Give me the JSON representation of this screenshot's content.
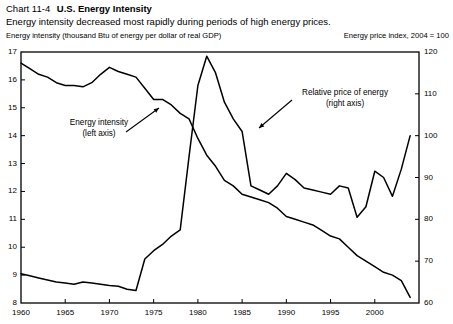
{
  "header": {
    "chart_number": "Chart 11-4",
    "title": "U.S. Energy Intensity",
    "subtitle": "Energy intensity decreased most rapidly during periods of high energy prices."
  },
  "axis_unit_labels": {
    "left": "Energy intensity (thousand Btu of energy per dollar of real GDP)",
    "right": "Energy price index, 2004 = 100"
  },
  "annotations": {
    "left_series": {
      "line1": "Energy intensity",
      "line2": "(left axis)"
    },
    "right_series": {
      "line1": "Relative price of energy",
      "line2": "(right axis)"
    }
  },
  "colors": {
    "line": "#000000",
    "frame": "#000000",
    "text": "#000000",
    "background": "#ffffff"
  },
  "chart_data": {
    "type": "line",
    "title": "U.S. Energy Intensity",
    "subtitle": "Energy intensity decreased most rapidly during periods of high energy prices.",
    "xlabel": "",
    "ylabel": "Energy intensity (thousand Btu of energy per dollar of real GDP)",
    "y2label": "Energy price index, 2004 = 100",
    "xlim": [
      1960,
      2005
    ],
    "ylim": [
      8,
      17
    ],
    "y2lim": [
      60,
      120
    ],
    "yticks": [
      8,
      9,
      10,
      11,
      12,
      13,
      14,
      15,
      16,
      17
    ],
    "y2ticks": [
      60,
      70,
      80,
      90,
      100,
      110,
      120
    ],
    "xticks": [
      1960,
      1965,
      1970,
      1975,
      1980,
      1985,
      1990,
      1995,
      2000
    ],
    "xtick_labels": [
      "1960",
      "1965",
      "1970",
      "1975",
      "1980",
      "1985",
      "1990",
      "1995",
      "2000"
    ],
    "grid": false,
    "legend": "annotations",
    "x": [
      1960,
      1961,
      1962,
      1963,
      1964,
      1965,
      1966,
      1967,
      1968,
      1969,
      1970,
      1971,
      1972,
      1973,
      1974,
      1975,
      1976,
      1977,
      1978,
      1979,
      1980,
      1981,
      1982,
      1983,
      1984,
      1985,
      1986,
      1987,
      1988,
      1989,
      1990,
      1991,
      1992,
      1993,
      1994,
      1995,
      1996,
      1997,
      1998,
      1999,
      2000,
      2001,
      2002,
      2003,
      2004
    ],
    "series": [
      {
        "name": "Energy intensity",
        "axis": "left",
        "unit": "thousand Btu per dollar of real GDP",
        "values": [
          16.6,
          16.4,
          16.2,
          16.1,
          15.9,
          15.8,
          15.8,
          15.75,
          15.9,
          16.2,
          16.45,
          16.3,
          16.2,
          16.1,
          15.7,
          15.3,
          15.3,
          15.1,
          14.8,
          14.6,
          13.9,
          13.3,
          12.9,
          12.4,
          12.2,
          11.9,
          11.8,
          11.7,
          11.6,
          11.4,
          11.1,
          11.0,
          10.9,
          10.8,
          10.6,
          10.4,
          10.3,
          10.0,
          9.7,
          9.5,
          9.3,
          9.1,
          9.0,
          8.8,
          8.2
        ]
      },
      {
        "name": "Relative price of energy",
        "axis": "right",
        "unit": "index, 2004 = 100",
        "values": [
          67.0,
          66.5,
          66.0,
          65.5,
          65.0,
          64.8,
          64.5,
          65.0,
          64.8,
          64.5,
          64.2,
          64.0,
          63.3,
          63.0,
          70.5,
          72.5,
          74.0,
          76.0,
          77.5,
          95.0,
          112.0,
          119.0,
          115.0,
          108.0,
          104.0,
          101.0,
          88.0,
          87.0,
          86.0,
          88.0,
          91.0,
          89.5,
          87.5,
          87.0,
          86.5,
          86.0,
          88.0,
          87.5,
          80.5,
          83.0,
          91.5,
          90.0,
          85.5,
          92.0,
          100.0
        ]
      }
    ],
    "annotations": [
      {
        "text": "Energy intensity (left axis)",
        "points_to_series": "Energy intensity",
        "points_to_x": 1976
      },
      {
        "text": "Relative price of energy (right axis)",
        "points_to_series": "Relative price of energy",
        "points_to_x": 1979
      }
    ]
  }
}
